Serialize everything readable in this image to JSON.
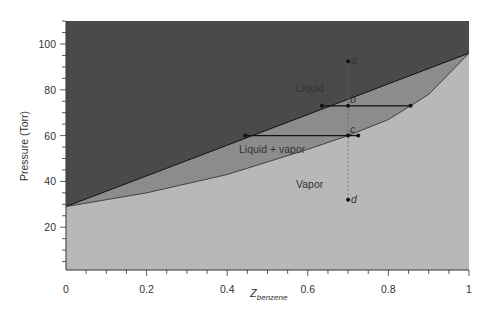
{
  "chart_data": {
    "type": "area",
    "title": "",
    "xlabel": "Z",
    "xlabel_subscript": "benzene",
    "ylabel": "Pressure (Torr)",
    "xlim": [
      0,
      1
    ],
    "ylim": [
      0,
      110
    ],
    "x_ticks": [
      "0",
      "0.2",
      "0.4",
      "0.6",
      "0.8",
      "1"
    ],
    "y_ticks": [
      "20",
      "40",
      "60",
      "80",
      "100"
    ],
    "grid": false,
    "regions": [
      {
        "name": "Liquid",
        "color": "#4a4a4a"
      },
      {
        "name": "Liquid + vapor",
        "color": "#8c8c8c"
      },
      {
        "name": "Vapor",
        "color": "#b8b8b8"
      }
    ],
    "series": [
      {
        "name": "Bubble-point (liquid) line",
        "x": [
          0,
          1
        ],
        "values": [
          29,
          96
        ]
      },
      {
        "name": "Dew-point (vapor) curve",
        "x": [
          0,
          0.2,
          0.4,
          0.6,
          0.7,
          0.8,
          0.9,
          1
        ],
        "values": [
          29,
          35,
          43,
          54,
          60,
          67,
          78,
          96
        ]
      }
    ],
    "points": [
      {
        "label": "a",
        "x": 0.7,
        "y": 92.5
      },
      {
        "label": "b",
        "x": 0.7,
        "y": 73
      },
      {
        "label": "c",
        "x": 0.7,
        "y": 60
      },
      {
        "label": "d",
        "x": 0.7,
        "y": 32
      }
    ],
    "tie_lines": [
      {
        "through": "b",
        "x_start": 0.635,
        "x_end": 0.855,
        "y": 73
      },
      {
        "through": "c",
        "x_start": 0.445,
        "x_end": 0.725,
        "y": 60
      }
    ],
    "annotations": [
      "Liquid",
      "Liquid + vapor",
      "Vapor",
      "a",
      "b",
      "c",
      "d"
    ],
    "vertical_dashed_line": {
      "x": 0.7,
      "y_start": 32,
      "y_end": 92.5
    }
  },
  "labels": {
    "liquid": "Liquid",
    "two_phase": "Liquid + vapor",
    "vapor": "Vapor",
    "a": "a",
    "b": "b",
    "c": "c",
    "d": "d",
    "xlabel_main": "Z",
    "xlabel_sub": "benzene",
    "ylabel": "Pressure (Torr)"
  }
}
